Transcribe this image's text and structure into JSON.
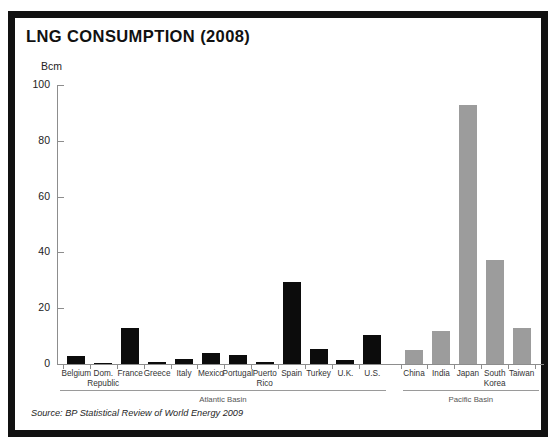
{
  "chart": {
    "title": "LNG CONSUMPTION (2008)",
    "y_unit_label": "Bcm",
    "source": "Source: BP Statistical Review of World Energy 2009",
    "colors": {
      "atlantic_bar": "#0c0c0c",
      "pacific_bar": "#9c9c9c",
      "frame": "#111111",
      "axis": "#8d8d8d",
      "background": "#ffffff"
    }
  },
  "chart_data": {
    "type": "bar",
    "title": "LNG CONSUMPTION (2008)",
    "subtitle": "",
    "xlabel": "",
    "ylabel": "Bcm",
    "ylim": [
      0,
      100
    ],
    "yticks": [
      0,
      20,
      40,
      60,
      80,
      100
    ],
    "ytick_labels": [
      "0",
      "20",
      "40",
      "60",
      "80",
      "100"
    ],
    "grid": false,
    "legend": "none",
    "annotations": [
      "Atlantic Basin",
      "Pacific Basin"
    ],
    "source": "Source: BP Statistical Review of World Energy 2009",
    "categories": [
      "Belgium",
      "Dom. Republic",
      "France",
      "Greece",
      "Italy",
      "Mexico",
      "Portugal",
      "Puerto Rico",
      "Spain",
      "Turkey",
      "U.K.",
      "U.S.",
      "China",
      "India",
      "Japan",
      "South Korea",
      "Taiwan"
    ],
    "values": [
      3.0,
      0.5,
      12.9,
      0.7,
      1.8,
      4.0,
      3.2,
      0.8,
      29.4,
      5.5,
      1.5,
      10.5,
      5.0,
      11.8,
      93.0,
      37.4,
      12.9
    ],
    "groups": [
      {
        "name": "Atlantic Basin",
        "color": "#0c0c0c",
        "categories": [
          "Belgium",
          "Dom. Republic",
          "France",
          "Greece",
          "Italy",
          "Mexico",
          "Portugal",
          "Puerto Rico",
          "Spain",
          "Turkey",
          "U.K.",
          "U.S."
        ],
        "values": [
          3.0,
          0.5,
          12.9,
          0.7,
          1.8,
          4.0,
          3.2,
          0.8,
          29.4,
          5.5,
          1.5,
          10.5
        ]
      },
      {
        "name": "Pacific Basin",
        "color": "#9c9c9c",
        "categories": [
          "China",
          "India",
          "Japan",
          "South Korea",
          "Taiwan"
        ],
        "values": [
          5.0,
          11.8,
          93.0,
          37.4,
          12.9
        ]
      }
    ],
    "bars": [
      {
        "label": "Belgium",
        "label_lines": [
          "Belgium"
        ],
        "value": 3.0,
        "group": "Atlantic Basin"
      },
      {
        "label": "Dom. Republic",
        "label_lines": [
          "Dom.",
          "Republic"
        ],
        "value": 0.5,
        "group": "Atlantic Basin"
      },
      {
        "label": "France",
        "label_lines": [
          "France"
        ],
        "value": 12.9,
        "group": "Atlantic Basin"
      },
      {
        "label": "Greece",
        "label_lines": [
          "Greece"
        ],
        "value": 0.7,
        "group": "Atlantic Basin"
      },
      {
        "label": "Italy",
        "label_lines": [
          "Italy"
        ],
        "value": 1.8,
        "group": "Atlantic Basin"
      },
      {
        "label": "Mexico",
        "label_lines": [
          "Mexico"
        ],
        "value": 4.0,
        "group": "Atlantic Basin"
      },
      {
        "label": "Portugal",
        "label_lines": [
          "Portugal"
        ],
        "value": 3.2,
        "group": "Atlantic Basin"
      },
      {
        "label": "Puerto Rico",
        "label_lines": [
          "Puerto",
          "Rico"
        ],
        "value": 0.8,
        "group": "Atlantic Basin"
      },
      {
        "label": "Spain",
        "label_lines": [
          "Spain"
        ],
        "value": 29.4,
        "group": "Atlantic Basin"
      },
      {
        "label": "Turkey",
        "label_lines": [
          "Turkey"
        ],
        "value": 5.5,
        "group": "Atlantic Basin"
      },
      {
        "label": "U.K.",
        "label_lines": [
          "U.K."
        ],
        "value": 1.5,
        "group": "Atlantic Basin"
      },
      {
        "label": "U.S.",
        "label_lines": [
          "U.S."
        ],
        "value": 10.5,
        "group": "Atlantic Basin"
      },
      {
        "label": "China",
        "label_lines": [
          "China"
        ],
        "value": 5.0,
        "group": "Pacific Basin"
      },
      {
        "label": "India",
        "label_lines": [
          "India"
        ],
        "value": 11.8,
        "group": "Pacific Basin"
      },
      {
        "label": "Japan",
        "label_lines": [
          "Japan"
        ],
        "value": 93.0,
        "group": "Pacific Basin"
      },
      {
        "label": "South Korea",
        "label_lines": [
          "South",
          "Korea"
        ],
        "value": 37.4,
        "group": "Pacific Basin"
      },
      {
        "label": "Taiwan",
        "label_lines": [
          "Taiwan"
        ],
        "value": 12.9,
        "group": "Pacific Basin"
      }
    ]
  }
}
